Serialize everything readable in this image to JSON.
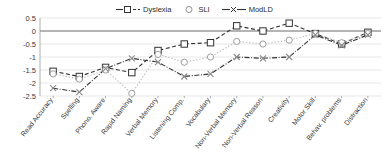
{
  "legend": {
    "position": "top-center",
    "entries": [
      {
        "label": "Dyslexia",
        "marker": "square-marker-icon",
        "color": "#333333"
      },
      {
        "label": "SLI",
        "marker": "circle-marker-icon",
        "color": "#9e9e9e"
      },
      {
        "label": "ModLD",
        "marker": "x-marker-icon",
        "color": "#333333"
      }
    ]
  },
  "chart_data": {
    "type": "line",
    "title": "",
    "subtitle": "",
    "xlabel": "",
    "ylabel": "",
    "ylim": [
      -2.5,
      0.5
    ],
    "yticks": [
      0.5,
      0,
      -0.5,
      -1,
      -1.5,
      -2,
      -2.5
    ],
    "ytick_labels": [
      "0.5",
      "0",
      "-0.5",
      "-1",
      "-1.5",
      "-2",
      "-2.5"
    ],
    "grid": true,
    "legend_position": "top-center",
    "categories": [
      "Read Accuracy",
      "Spelling",
      "Phono. Aware",
      "Rapid Naming",
      "Verbal Memory",
      "Listening Comp.",
      "Vocabulary",
      "Non-Verbal Memory",
      "Non-Verbal Reason",
      "Creativity",
      "Motor Skill",
      "Behav. problems",
      "Distraction"
    ],
    "series": [
      {
        "name": "Dyslexia",
        "marker": "square",
        "values": [
          -1.55,
          -1.75,
          -1.4,
          -1.6,
          -0.75,
          -0.5,
          -0.45,
          0.2,
          0.0,
          0.3,
          -0.1,
          -0.5,
          -0.05
        ]
      },
      {
        "name": "SLI",
        "marker": "circle",
        "values": [
          -1.65,
          -1.85,
          -1.5,
          -2.4,
          -0.9,
          -1.2,
          -1.0,
          -0.4,
          -0.5,
          -0.35,
          -0.1,
          -0.45,
          -0.1
        ]
      },
      {
        "name": "ModLD",
        "marker": "x",
        "values": [
          -2.2,
          -2.35,
          -1.45,
          -1.05,
          -1.2,
          -1.75,
          -1.65,
          -1.0,
          -1.05,
          -1.0,
          -0.15,
          -0.55,
          -0.15
        ]
      }
    ]
  }
}
